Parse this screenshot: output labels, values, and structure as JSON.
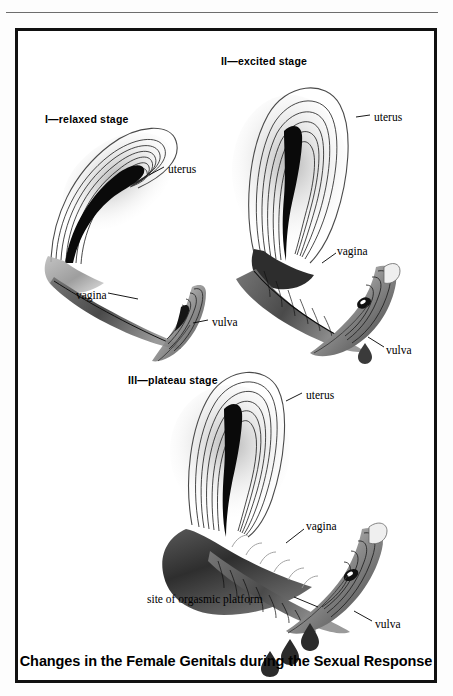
{
  "figure": {
    "caption": "Changes in the Female Genitals during the Sexual Response",
    "top_rule": true,
    "border_color": "#111111",
    "background": "#ffffff",
    "ink_color": "#000000",
    "wash_color": "#8f8f8f"
  },
  "stages": [
    {
      "id": "stage-1",
      "title": "I—relaxed stage",
      "title_pos": {
        "x": 27,
        "y": 88
      },
      "labels": [
        {
          "name": "uterus",
          "text": "uterus",
          "x": 150,
          "y": 139,
          "leader": "up-left"
        },
        {
          "name": "vagina",
          "text": "vagina",
          "x": 58,
          "y": 265,
          "leader": "right"
        },
        {
          "name": "vulva",
          "text": "vulva",
          "x": 192,
          "y": 292,
          "leader": "left"
        }
      ]
    },
    {
      "id": "stage-2",
      "title": "II—excited stage",
      "title_pos": {
        "x": 203,
        "y": 30
      },
      "labels": [
        {
          "name": "uterus",
          "text": "uterus",
          "x": 356,
          "y": 87,
          "leader": "left"
        },
        {
          "name": "vagina",
          "text": "vagina",
          "x": 319,
          "y": 221,
          "leader": "down-left"
        },
        {
          "name": "vulva",
          "text": "vulva",
          "x": 368,
          "y": 320,
          "leader": "up-left"
        }
      ]
    },
    {
      "id": "stage-3",
      "title": "III—plateau stage",
      "title_pos": {
        "x": 110,
        "y": 349
      },
      "labels": [
        {
          "name": "uterus",
          "text": "uterus",
          "x": 288,
          "y": 365,
          "leader": "up-left"
        },
        {
          "name": "vagina",
          "text": "vagina",
          "x": 288,
          "y": 496,
          "leader": "down-left"
        },
        {
          "name": "orgasmic-platform",
          "text": "site of orgasmic platform",
          "x": 144,
          "y": 569,
          "leader": "right"
        },
        {
          "name": "vulva",
          "text": "vulva",
          "x": 357,
          "y": 594,
          "leader": "up-left"
        }
      ]
    }
  ],
  "anatomy_terms": [
    "uterus",
    "vagina",
    "vulva",
    "site of orgasmic platform"
  ],
  "droplets": {
    "stage_2_count": 1,
    "stage_3_count": 3
  }
}
